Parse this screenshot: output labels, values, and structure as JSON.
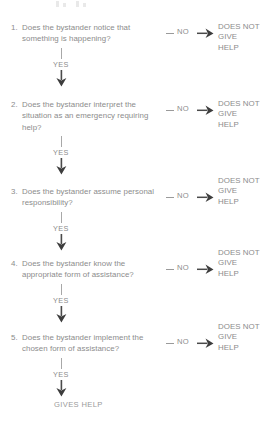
{
  "diagram": {
    "colors": {
      "background": "#ffffff",
      "text": "#8c8c8c",
      "line": "#9a9a9a",
      "arrow": "#4a4a4a"
    },
    "labels": {
      "yes": "YES",
      "no": "NO",
      "outcome": "DOES NOT\nGIVE\nHELP",
      "terminal": "GIVES HELP"
    },
    "steps": [
      {
        "number": "1.",
        "question": "Does the bystander notice that something is happening?",
        "no_label": "NO",
        "no_outcome": "DOES NOT\nGIVE\nHELP",
        "yes_label": "YES"
      },
      {
        "number": "2.",
        "question": "Does the bystander interpret the situation as an emergency requiring help?",
        "no_label": "NO",
        "no_outcome": "DOES NOT\nGIVE\nHELP",
        "yes_label": "YES"
      },
      {
        "number": "3.",
        "question": "Does the bystander assume personal responsibility?",
        "no_label": "NO",
        "no_outcome": "DOES NOT\nGIVE\nHELP",
        "yes_label": "YES"
      },
      {
        "number": "4.",
        "question": "Does the bystander know the appropriate form of assistance?",
        "no_label": "NO",
        "no_outcome": "DOES NOT\nGIVE\nHELP",
        "yes_label": "YES"
      },
      {
        "number": "5.",
        "question": "Does the bystander implement the chosen form of assistance?",
        "no_label": "NO",
        "no_outcome": "DOES NOT\nGIVE\nHELP",
        "yes_label": "YES"
      }
    ],
    "final_outcome": "GIVES HELP"
  }
}
